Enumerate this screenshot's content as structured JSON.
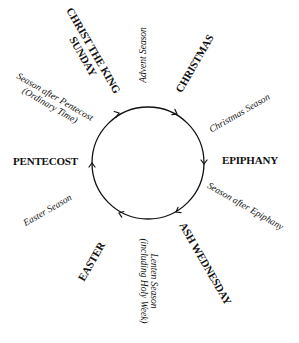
{
  "diagram": {
    "circle": {
      "cx": 148,
      "cy": 163,
      "r": 56,
      "stroke": "#111111",
      "direction": "clockwise"
    },
    "feasts": [
      {
        "id": "christ-the-king",
        "line1": "CHRIST THE KING",
        "line2": "SUNDAY"
      },
      {
        "id": "christmas",
        "label": "CHRISTMAS"
      },
      {
        "id": "epiphany",
        "label": "EPIPHANY"
      },
      {
        "id": "ash-wednesday",
        "label": "ASH WEDNESDAY"
      },
      {
        "id": "easter",
        "label": "EASTER"
      },
      {
        "id": "pentecost",
        "label": "PENTECOST"
      }
    ],
    "seasons": [
      {
        "id": "advent",
        "label": "Advent Season"
      },
      {
        "id": "christmas-season",
        "label": "Christmas Season"
      },
      {
        "id": "after-epiphany",
        "label": "Season after Epiphany"
      },
      {
        "id": "lent",
        "line1": "Lenten Season",
        "line2": "(including Holy Week)"
      },
      {
        "id": "easter-season",
        "label": "Easter Season"
      },
      {
        "id": "after-pentecost",
        "line1": "Season after Pentecost",
        "line2": "(Ordinary Time)"
      }
    ]
  }
}
